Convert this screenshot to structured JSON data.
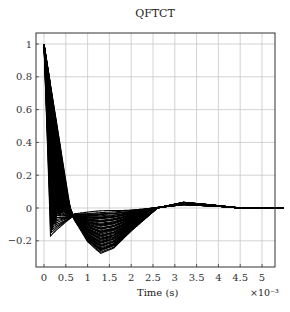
{
  "chart_data": {
    "type": "line",
    "title": "QFTCT",
    "xlabel": "Time (s)",
    "x_multiplier": "×10⁻³",
    "ylabel": "",
    "xlim": [
      -0.2,
      5.3
    ],
    "ylim": [
      -0.36,
      1.07
    ],
    "x_ticks": [
      "0",
      "0.5",
      "1",
      "1.5",
      "2",
      "2.5",
      "3",
      "3.5",
      "4",
      "4.5",
      "5"
    ],
    "y_ticks": [
      "−0.2",
      "0",
      "0.2",
      "0.4",
      "0.6",
      "0.8",
      "1"
    ],
    "grid": true,
    "legend": null,
    "series": [
      {
        "name": "envelope-fast",
        "x": [
          0,
          0.15,
          0.3,
          0.7,
          1.2,
          1.8,
          2.5,
          3.2,
          4.0,
          4.5,
          5.3
        ],
        "y": [
          1.0,
          -0.17,
          -0.13,
          -0.04,
          -0.03,
          -0.02,
          0.0,
          0.02,
          0.01,
          0.0,
          0.0
        ]
      },
      {
        "name": "envelope-slow",
        "x": [
          0,
          0.6,
          0.7,
          1.0,
          1.3,
          1.6,
          2.0,
          2.6,
          3.2,
          3.8,
          4.5,
          5.3
        ],
        "y": [
          1.0,
          0.0,
          -0.07,
          -0.2,
          -0.27,
          -0.24,
          -0.14,
          0.0,
          0.035,
          0.02,
          0.0,
          0.0
        ]
      }
    ]
  }
}
